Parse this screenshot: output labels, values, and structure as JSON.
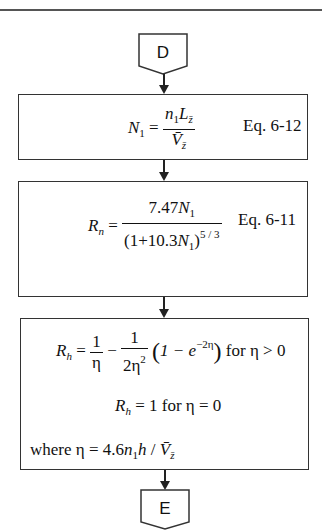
{
  "connectors": {
    "start": {
      "label": "D"
    },
    "end": {
      "label": "E"
    }
  },
  "boxes": [
    {
      "lhs": "N",
      "lhs_sub": "1",
      "num": "n",
      "num_sub": "1",
      "num_L": "L",
      "num_L_sub": "z̄",
      "den": "V̄",
      "den_sub": "z̄",
      "eq_label": "Eq. 6-12"
    },
    {
      "lhs": "R",
      "lhs_sub": "n",
      "num_coef": "7.47",
      "num_var": "N",
      "num_var_sub": "1",
      "den_open": "(1+10.3",
      "den_var": "N",
      "den_var_sub": "1",
      "den_close": ")",
      "den_exp": "5 / 3",
      "eq_label": "Eq. 6-11"
    },
    {
      "line1": {
        "lhs": "R",
        "lhs_sub": "h",
        "f1_num": "1",
        "f1_den": "η",
        "f2_num": "1",
        "f2_den": "2η",
        "f2_den_exp": "2",
        "paren_body": "1 − e",
        "paren_exp": "−2η",
        "condition": "for  η > 0"
      },
      "line2": {
        "lhs": "R",
        "lhs_sub": "h",
        "rhs": "= 1  for η = 0"
      },
      "line3": {
        "prefix": "where  η = 4.6",
        "n": "n",
        "n_sub": "1",
        "h": "h",
        "slash": " / ",
        "V": "V̄",
        "V_sub": "z̄"
      }
    }
  ]
}
